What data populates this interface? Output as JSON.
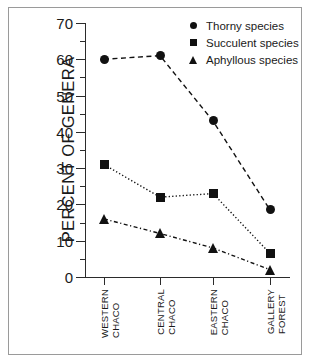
{
  "chart_data": {
    "type": "line",
    "title": "",
    "xlabel": "",
    "ylabel": "PERCENT OF GENERA",
    "ylim": [
      0,
      70
    ],
    "ytick_step": 10,
    "yminor_step": 5,
    "grid": false,
    "legend_position": "top-right",
    "categories": [
      "WESTERN CHACO",
      "CENTRAL CHACO",
      "EASTERN CHACO",
      "GALLERY FOREST"
    ],
    "category_lines": [
      [
        "WESTERN",
        "CHACO"
      ],
      [
        "CENTRAL",
        "CHACO"
      ],
      [
        "EASTERN",
        "CHACO"
      ],
      [
        "GALLERY",
        "FOREST"
      ]
    ],
    "ytick_labels": [
      "0",
      "10",
      "20",
      "30",
      "40",
      "50",
      "60",
      "70"
    ],
    "ytick_values": [
      0,
      10,
      20,
      30,
      40,
      50,
      60,
      70
    ],
    "series": [
      {
        "name": "Thorny species",
        "marker": "circle",
        "linestyle": "dashed",
        "color": "#111111",
        "values": [
          60,
          61,
          43,
          18.5
        ]
      },
      {
        "name": "Succulent species",
        "marker": "square",
        "linestyle": "dotted",
        "color": "#111111",
        "values": [
          31,
          22,
          23,
          6.5
        ]
      },
      {
        "name": "Aphyllous species",
        "marker": "triangle",
        "linestyle": "dash-dot",
        "color": "#111111",
        "values": [
          16,
          12,
          8,
          2
        ]
      }
    ]
  },
  "legend": {
    "items": [
      {
        "label": "Thorny species",
        "marker": "circle-marker-icon"
      },
      {
        "label": "Succulent species",
        "marker": "square-marker-icon"
      },
      {
        "label": "Aphyllous species",
        "marker": "triangle-marker-icon"
      }
    ]
  }
}
